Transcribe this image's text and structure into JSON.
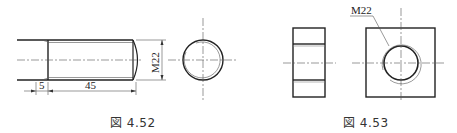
{
  "figures": [
    {
      "id": "fig-4-52",
      "caption": "図 4.52",
      "subject": "bolt-thread",
      "dimensions": {
        "chamfer_length": "5",
        "thread_length": "45",
        "thread_size": "M22"
      }
    },
    {
      "id": "fig-4-53",
      "caption": "図 4.53",
      "subject": "nut",
      "dimensions": {
        "thread_size": "M22"
      }
    }
  ],
  "colors": {
    "line": "#222222",
    "thin_line": "#555555",
    "background": "#ffffff"
  }
}
